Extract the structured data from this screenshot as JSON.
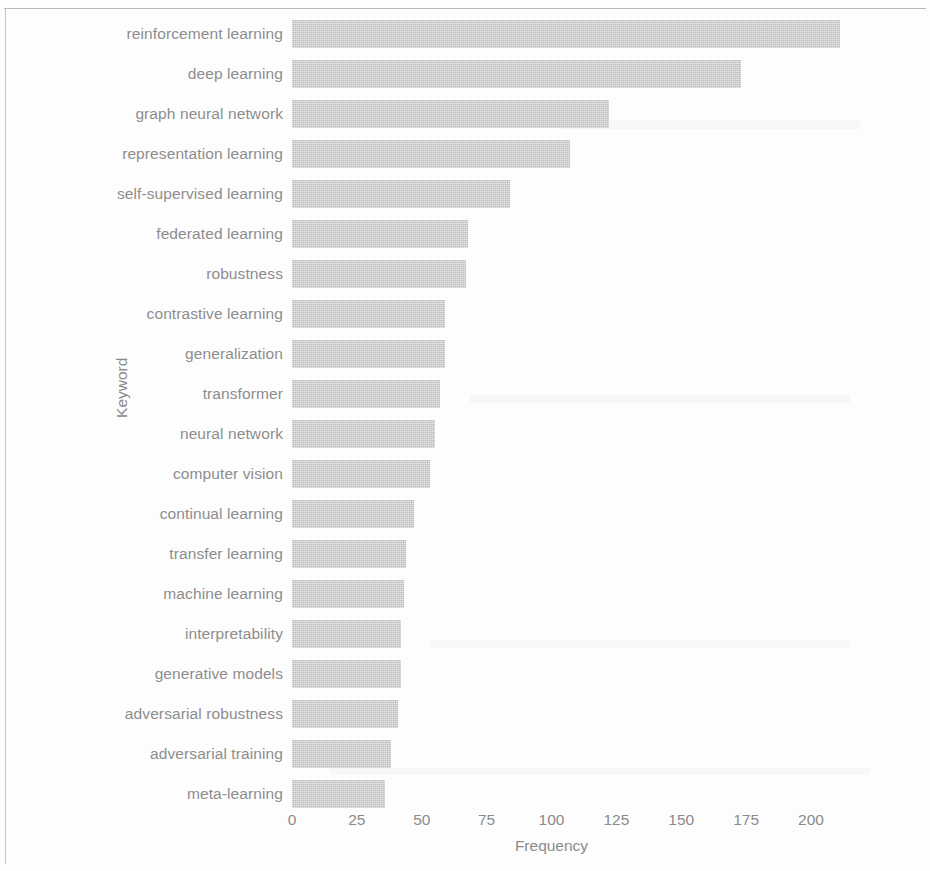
{
  "chart_data": {
    "type": "bar",
    "orientation": "horizontal",
    "title": "",
    "xlabel": "Frequency",
    "ylabel": "Keyword",
    "xlim": [
      0,
      215
    ],
    "xticks": [
      0,
      25,
      50,
      75,
      100,
      125,
      150,
      175,
      200
    ],
    "xtick_labels": [
      "0",
      "25",
      "50",
      "75",
      "100",
      "125",
      "150",
      "175",
      "200"
    ],
    "grid": false,
    "legend": null,
    "bar_color": "#cdcdcd",
    "categories": [
      "reinforcement learning",
      "deep learning",
      "graph neural network",
      "representation learning",
      "self-supervised learning",
      "federated learning",
      "robustness",
      "contrastive learning",
      "generalization",
      "transformer",
      "neural network",
      "computer vision",
      "continual learning",
      "transfer learning",
      "machine learning",
      "interpretability",
      "generative models",
      "adversarial robustness",
      "adversarial training",
      "meta-learning"
    ],
    "values": [
      211,
      173,
      122,
      107,
      84,
      68,
      67,
      59,
      59,
      57,
      55,
      53,
      47,
      44,
      43,
      42,
      42,
      41,
      38,
      36
    ]
  }
}
